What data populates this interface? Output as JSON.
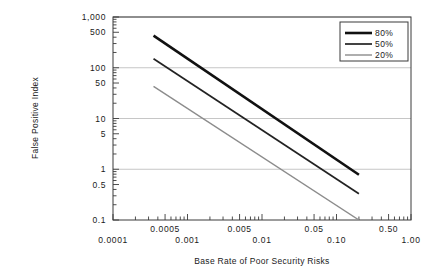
{
  "chart_data": {
    "type": "line",
    "title": "",
    "xlabel": "Base Rate of Poor Security Risks",
    "ylabel": "False Positive Index",
    "xscale": "log",
    "yscale": "log",
    "xlim": [
      0.0001,
      1.0
    ],
    "ylim": [
      0.1,
      1000
    ],
    "grid": "horizontal-major",
    "legend_position": "top-right",
    "xtick_labels": [
      "0.0001",
      "0.0005",
      "0.001",
      "0.005",
      "0.01",
      "0.05",
      "0.10",
      "0.50",
      "1.00"
    ],
    "xtick_values": [
      0.0001,
      0.0005,
      0.001,
      0.005,
      0.01,
      0.05,
      0.1,
      0.5,
      1.0
    ],
    "ytick_labels": [
      "1,000",
      "500",
      "100",
      "50",
      "10",
      "5",
      "1",
      "0.5",
      "0.1"
    ],
    "ytick_values": [
      1000,
      500,
      100,
      50,
      10,
      5,
      1,
      0.5,
      0.1
    ],
    "gridline_values": [
      1000,
      100,
      10,
      1
    ],
    "series": [
      {
        "name": "80%",
        "color": "#111111",
        "width": 2.6,
        "points": [
          [
            0.00035,
            430
          ],
          [
            0.2,
            0.78
          ]
        ]
      },
      {
        "name": "50%",
        "color": "#222222",
        "width": 1.7,
        "points": [
          [
            0.00035,
            150
          ],
          [
            0.2,
            0.33
          ]
        ]
      },
      {
        "name": "20%",
        "color": "#8c8c8c",
        "width": 1.4,
        "points": [
          [
            0.00035,
            43
          ],
          [
            0.2,
            0.1
          ]
        ]
      }
    ]
  },
  "legend": {
    "entries": [
      {
        "label": "80%"
      },
      {
        "label": "50%"
      },
      {
        "label": "20%"
      }
    ]
  }
}
